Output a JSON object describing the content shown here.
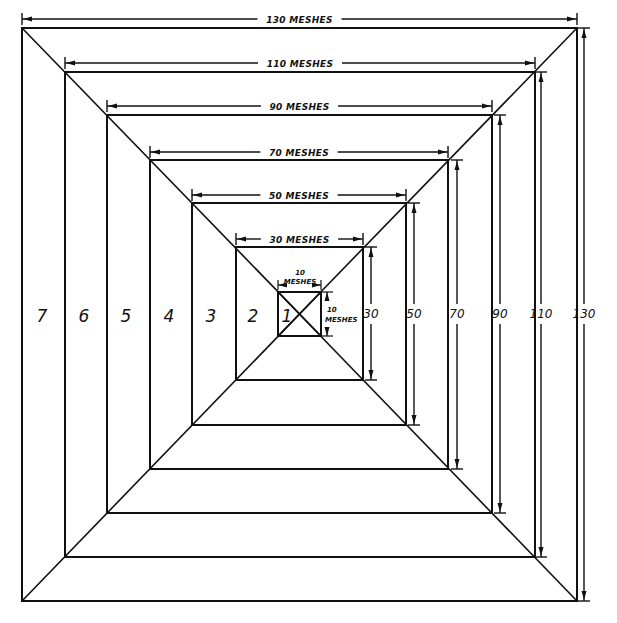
{
  "colors": {
    "line": "#111111",
    "background": "#ffffff"
  },
  "squares": [
    {
      "zone": "1",
      "size": 10,
      "x1": 278,
      "y1": 292,
      "x2": 321,
      "y2": 336
    },
    {
      "zone": "2",
      "size": 30,
      "x1": 236,
      "y1": 247,
      "x2": 363,
      "y2": 380
    },
    {
      "zone": "3",
      "size": 50,
      "x1": 192,
      "y1": 203,
      "x2": 406,
      "y2": 425
    },
    {
      "zone": "4",
      "size": 70,
      "x1": 150,
      "y1": 160,
      "x2": 448,
      "y2": 469
    },
    {
      "zone": "5",
      "size": 90,
      "x1": 107,
      "y1": 115,
      "x2": 492,
      "y2": 513
    },
    {
      "zone": "6",
      "size": 110,
      "x1": 65,
      "y1": 72,
      "x2": 535,
      "y2": 557
    },
    {
      "zone": "7",
      "size": 130,
      "x1": 22,
      "y1": 28,
      "x2": 577,
      "y2": 601
    }
  ],
  "top_dimensions": [
    {
      "label": "130 MESHES",
      "y": 19
    },
    {
      "label": "110 MESHES",
      "y": 63
    },
    {
      "label": "90 MESHES",
      "y": 106
    },
    {
      "label": "70 MESHES",
      "y": 152
    },
    {
      "label": "50 MESHES",
      "y": 195
    },
    {
      "label": "30 MESHES",
      "y": 239
    }
  ],
  "inner_top_dimension": {
    "line1": "10",
    "line2": "MESHES"
  },
  "inner_side_dimension": {
    "line1": "10",
    "line2": "MESHES"
  },
  "side_dimensions": [
    {
      "label": "30",
      "x": 371
    },
    {
      "label": "50",
      "x": 414
    },
    {
      "label": "70",
      "x": 457
    },
    {
      "label": "90",
      "x": 500
    },
    {
      "label": "110",
      "x": 541
    },
    {
      "label": "130",
      "x": 584
    }
  ],
  "zone_labels": [
    {
      "label": "7",
      "x": 42
    },
    {
      "label": "6",
      "x": 84
    },
    {
      "label": "5",
      "x": 126
    },
    {
      "label": "4",
      "x": 169
    },
    {
      "label": "3",
      "x": 211
    },
    {
      "label": "2",
      "x": 253
    },
    {
      "label": "1",
      "x": 287
    }
  ]
}
